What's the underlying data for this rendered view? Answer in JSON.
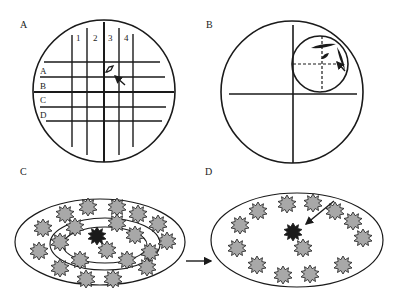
{
  "panels": {
    "A": {
      "label": "A",
      "column_labels": [
        "1",
        "2",
        "3",
        "4"
      ],
      "row_labels": [
        "A",
        "B",
        "C",
        "D"
      ],
      "circle": {
        "cx": 104,
        "cy": 91,
        "r": 71
      },
      "vlines_x": [
        72,
        87,
        104,
        119,
        133
      ],
      "hlines_y": [
        62,
        77,
        92,
        107,
        121
      ]
    },
    "B": {
      "label": "B",
      "circle": {
        "cx": 292,
        "cy": 92,
        "r": 71
      },
      "inner_circle": {
        "cx": 320,
        "cy": 64,
        "r": 28
      }
    },
    "C": {
      "label": "C",
      "outer_ellipse": {
        "cx": 100,
        "cy": 242,
        "rx": 85,
        "ry": 43
      },
      "middle_ellipse": {
        "cx": 105,
        "cy": 244,
        "rx": 55,
        "ry": 26
      },
      "inner_ellipse": {
        "cx": 105,
        "cy": 245,
        "rx": 42,
        "ry": 18
      }
    },
    "D": {
      "label": "D",
      "ellipse": {
        "cx": 297,
        "cy": 240,
        "rx": 86,
        "ry": 47
      }
    }
  },
  "colors": {
    "stroke": "#1a1a1a",
    "star_fill": "#a8a8a8",
    "dark_star_fill": "#1a1a1a"
  }
}
